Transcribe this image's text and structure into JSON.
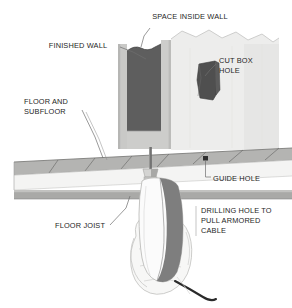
{
  "figure": {
    "background_color": "#ffffff",
    "width": 292,
    "height": 308
  },
  "colors": {
    "paper": "#ffffff",
    "wall_face": "#ededec",
    "wall_face_shadow": "#e2e2e1",
    "wall_cavity": "#5e5e5e",
    "wall_edge": "#c9c9c7",
    "wall_edge_dark": "#b0b0ae",
    "box_hole": "#4f4f4f",
    "floor_top": "#b4b4b2",
    "floor_front": "#f2f2f1",
    "floor_edge": "#8d8d8b",
    "joist": "#a9a9a7",
    "drill_light": "#fbfbfb",
    "drill_shade": "#7e7e7e",
    "drill_chuck": "#d0d0ce",
    "hand": "#f6f6f5",
    "hand_outline": "#bdbdbb",
    "cable": "#2a2a2a",
    "leader": "#6f6f6f",
    "text": "#1e1e1e"
  },
  "labels": [
    {
      "id": "space-inside-wall",
      "lines": [
        "SPACE INSIDE WALL"
      ],
      "x": 190,
      "y": 19,
      "anchor": "middle"
    },
    {
      "id": "finished-wall",
      "lines": [
        "FINISHED WALL"
      ],
      "x": 78,
      "y": 48,
      "anchor": "middle"
    },
    {
      "id": "cut-box-hole",
      "lines": [
        "CUT BOX",
        "HOLE"
      ],
      "x": 219,
      "y": 63,
      "anchor": "start"
    },
    {
      "id": "floor-and-subfloor",
      "lines": [
        "FLOOR AND",
        "SUBFLOOR"
      ],
      "x": 24,
      "y": 104,
      "anchor": "start"
    },
    {
      "id": "guide-hole",
      "lines": [
        "GUIDE HOLE"
      ],
      "x": 213,
      "y": 181,
      "anchor": "start"
    },
    {
      "id": "floor-joist",
      "lines": [
        "FLOOR JOIST"
      ],
      "x": 55,
      "y": 228,
      "anchor": "start"
    },
    {
      "id": "drilling-hole-to-pull-armored-cable",
      "lines": [
        "DRILLING HOLE TO",
        "PULL ARMORED",
        "CABLE"
      ],
      "x": 201,
      "y": 213,
      "anchor": "start"
    }
  ],
  "parts": [
    {
      "id": "finished-wall-surface",
      "name": "Finished wall surface"
    },
    {
      "id": "wall-cavity",
      "name": "Space inside wall"
    },
    {
      "id": "cut-box-hole",
      "name": "Cut box hole"
    },
    {
      "id": "floor-and-subfloor",
      "name": "Floor and subfloor"
    },
    {
      "id": "floor-joist",
      "name": "Floor joist"
    },
    {
      "id": "guide-hole",
      "name": "Guide hole"
    },
    {
      "id": "drill",
      "name": "Power drill"
    },
    {
      "id": "hand",
      "name": "Hand gripping drill"
    },
    {
      "id": "power-cord",
      "name": "Drill power cord"
    }
  ]
}
